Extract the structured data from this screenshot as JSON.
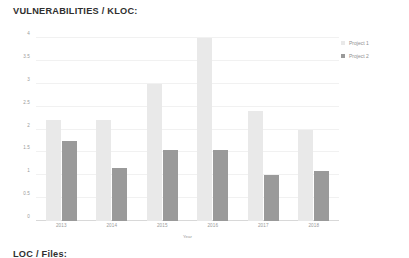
{
  "chart_data": {
    "type": "bar",
    "title": "VULNERABILITIES / KLOC:",
    "xlabel": "Year",
    "ylabel": "",
    "categories": [
      "2013",
      "2014",
      "2015",
      "2016",
      "2017",
      "2018"
    ],
    "series": [
      {
        "name": "Project 1",
        "color": "#e9e9e9",
        "values": [
          2.2,
          2.2,
          3.0,
          4.0,
          2.4,
          2.0
        ]
      },
      {
        "name": "Project 2",
        "color": "#9a9a9a",
        "values": [
          1.75,
          1.15,
          1.55,
          1.55,
          1.0,
          1.1
        ]
      }
    ],
    "ylim": [
      0,
      4
    ],
    "yticks": [
      "0",
      "0.5",
      "1",
      "1.5",
      "2",
      "2.5",
      "3",
      "3.5",
      "4"
    ],
    "ytick_values": [
      0,
      0.5,
      1,
      1.5,
      2,
      2.5,
      3,
      3.5,
      4
    ],
    "grid": true,
    "legend_position": "right-top"
  },
  "footer": {
    "heading": "LOC / Files:"
  }
}
